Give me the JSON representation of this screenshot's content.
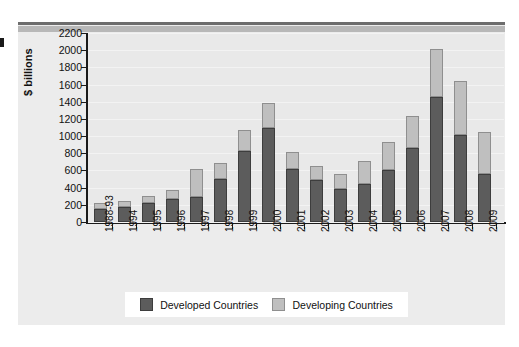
{
  "chart_data": {
    "type": "bar",
    "stacked": true,
    "title": "",
    "xlabel": "",
    "ylabel": "$ billions",
    "ylim": [
      0,
      2200
    ],
    "ytick_step": 200,
    "yticks": [
      "2200",
      "2000",
      "1800",
      "1600",
      "1400",
      "1200",
      "1000",
      "800",
      "600",
      "400",
      "200",
      "0"
    ],
    "grid": true,
    "legend_position": "bottom",
    "categories": [
      "1988-93",
      "1994",
      "1995",
      "1996",
      "1997",
      "1998",
      "1999",
      "2000",
      "2001",
      "2002",
      "2003",
      "2004",
      "2005",
      "2006",
      "2007",
      "2008",
      "2009"
    ],
    "series": [
      {
        "name": "Developed Countries",
        "color": "#5c5c5c",
        "values": [
          150,
          170,
          220,
          270,
          290,
          500,
          830,
          1090,
          620,
          490,
          380,
          440,
          610,
          860,
          1450,
          1010,
          560
        ]
      },
      {
        "name": "Developing Countries",
        "color": "#bfbfbf",
        "values": [
          70,
          75,
          85,
          100,
          330,
          190,
          240,
          300,
          190,
          160,
          180,
          270,
          320,
          370,
          560,
          630,
          490
        ]
      }
    ],
    "totals": [
      220,
      245,
      305,
      370,
      620,
      690,
      1070,
      1390,
      810,
      650,
      560,
      710,
      930,
      1230,
      2010,
      1640,
      1050
    ]
  },
  "legend": {
    "items": [
      {
        "label": "Developed Countries"
      },
      {
        "label": "Developing Countries"
      }
    ]
  }
}
